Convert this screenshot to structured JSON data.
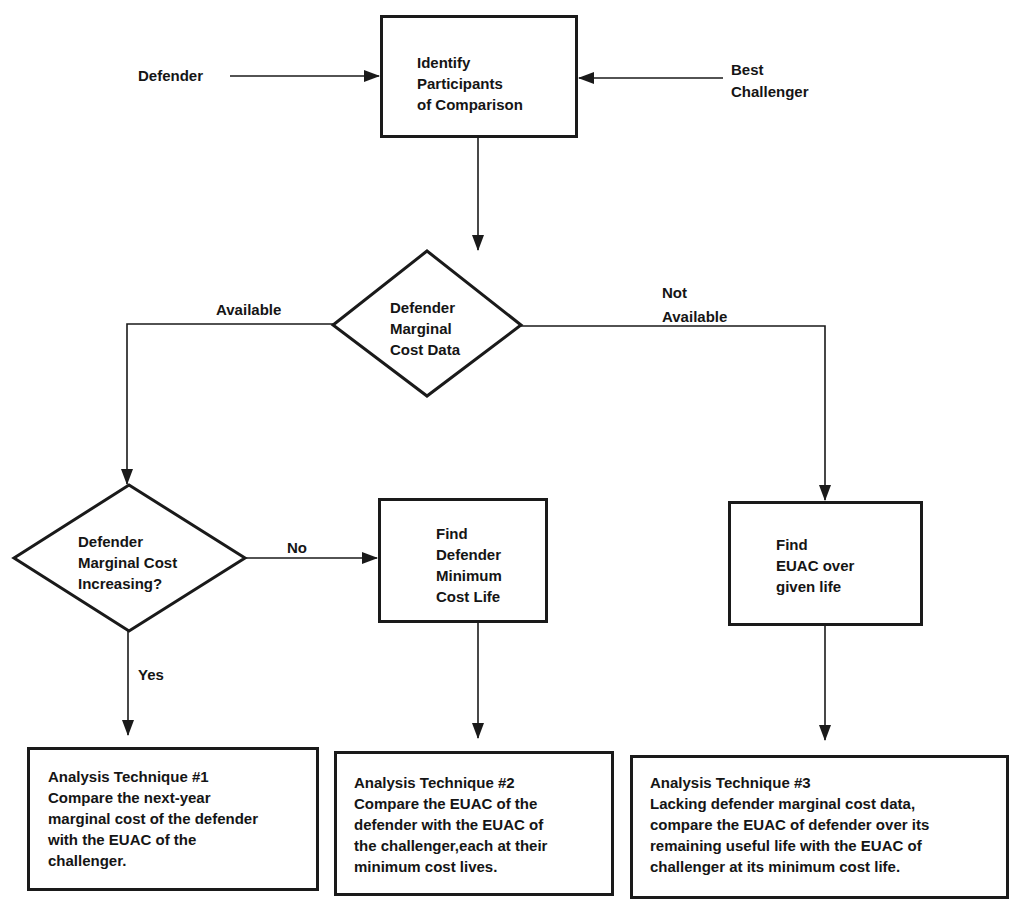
{
  "diagram": {
    "type": "flowchart",
    "inputs": {
      "left": "Defender",
      "right": "Best\nChallenger"
    },
    "nodes": {
      "identify": {
        "shape": "rectangle",
        "text": "Identify\nParticipants\nof Comparison"
      },
      "marginal_data": {
        "shape": "diamond",
        "text": "Defender\nMarginal\nCost Data"
      },
      "marginal_increasing": {
        "shape": "diamond",
        "text": "Defender\nMarginal Cost\nIncreasing?"
      },
      "find_min_life": {
        "shape": "rectangle",
        "text": "Find\nDefender\nMinimum\nCost Life"
      },
      "find_euac": {
        "shape": "rectangle",
        "text": "Find\nEUAC over\ngiven life"
      },
      "technique1": {
        "shape": "rectangle",
        "text": "Analysis Technique #1\nCompare the next-year\nmarginal cost of the defender\nwith the EUAC of the\nchallenger."
      },
      "technique2": {
        "shape": "rectangle",
        "text": "Analysis Technique #2\nCompare the EUAC of the\ndefender with the EUAC of\nthe challenger,each at their\nminimum cost lives."
      },
      "technique3": {
        "shape": "rectangle",
        "text": "Analysis Technique #3\nLacking defender marginal cost data,\ncompare the EUAC of defender over its\nremaining useful life with the EUAC of\nchallenger at its minimum cost life."
      }
    },
    "edge_labels": {
      "available": "Available",
      "not_available": "Not\nAvailable",
      "no": "No",
      "yes": "Yes"
    },
    "edges": [
      {
        "from": "Defender",
        "to": "identify"
      },
      {
        "from": "Best Challenger",
        "to": "identify"
      },
      {
        "from": "identify",
        "to": "marginal_data"
      },
      {
        "from": "marginal_data",
        "to": "marginal_increasing",
        "label": "Available"
      },
      {
        "from": "marginal_data",
        "to": "find_euac",
        "label": "Not Available"
      },
      {
        "from": "marginal_increasing",
        "to": "find_min_life",
        "label": "No"
      },
      {
        "from": "marginal_increasing",
        "to": "technique1",
        "label": "Yes"
      },
      {
        "from": "find_min_life",
        "to": "technique2"
      },
      {
        "from": "find_euac",
        "to": "technique3"
      }
    ],
    "colors": {
      "line": "#1a1a1a",
      "background": "#ffffff"
    }
  }
}
